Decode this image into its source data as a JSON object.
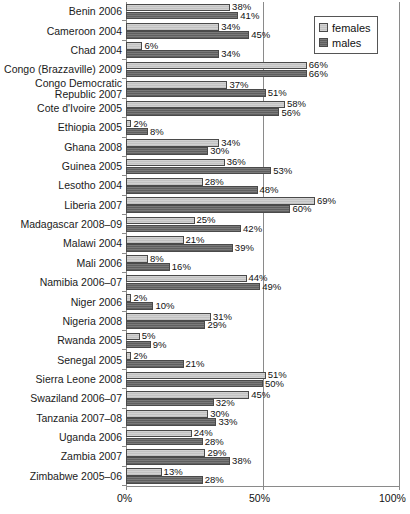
{
  "chart_data": {
    "type": "bar",
    "orientation": "horizontal",
    "title": "",
    "xlabel": "",
    "ylabel": "",
    "xlim": [
      0,
      100
    ],
    "xticks": [
      "0%",
      "50%",
      "100%"
    ],
    "xtick_values": [
      0,
      50,
      100
    ],
    "grid": true,
    "legend_position": "top-right",
    "value_label_suffix": "%",
    "categories": [
      "Benin 2006",
      "Cameroon 2004",
      "Chad 2004",
      "Congo (Brazzaville) 2009",
      "Congo Democratic\nRepublic 2007",
      "Cote d'Ivoire 2005",
      "Ethiopia 2005",
      "Ghana 2008",
      "Guinea 2005",
      "Lesotho 2004",
      "Liberia 2007",
      "Madagascar 2008–09",
      "Malawi 2004",
      "Mali 2006",
      "Namibia 2006–07",
      "Niger 2006",
      "Nigeria 2008",
      "Rwanda 2005",
      "Senegal 2005",
      "Sierra Leone 2008",
      "Swaziland 2006–07",
      "Tanzania 2007–08",
      "Uganda 2006",
      "Zambia 2007",
      "Zimbabwe 2005–06"
    ],
    "series": [
      {
        "name": "females",
        "color": "#c9c9c9",
        "values": [
          38,
          34,
          6,
          66,
          37,
          58,
          2,
          34,
          36,
          28,
          69,
          25,
          21,
          8,
          44,
          2,
          31,
          5,
          2,
          51,
          45,
          30,
          24,
          29,
          13
        ]
      },
      {
        "name": "males",
        "color": "#6e6e6e",
        "values": [
          41,
          45,
          34,
          66,
          51,
          56,
          8,
          30,
          53,
          48,
          60,
          42,
          39,
          16,
          49,
          10,
          29,
          9,
          21,
          50,
          32,
          33,
          28,
          38,
          28
        ]
      }
    ]
  },
  "legend": {
    "items": [
      {
        "label": "females",
        "swatch": "females"
      },
      {
        "label": "males",
        "swatch": "males"
      }
    ]
  }
}
